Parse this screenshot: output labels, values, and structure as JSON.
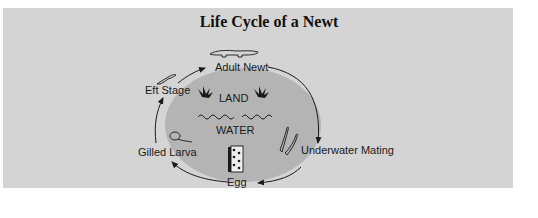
{
  "title": "Life Cycle of a Newt",
  "zones": {
    "land": "LAND",
    "water": "WATER"
  },
  "stages": [
    {
      "id": "adult",
      "label": "Adult Newt",
      "icon": "adult-newt-icon"
    },
    {
      "id": "mating",
      "label": "Underwater Mating",
      "icon": "mating-newts-icon"
    },
    {
      "id": "egg",
      "label": "Egg",
      "icon": "egg-mass-icon"
    },
    {
      "id": "larva",
      "label": "Gilled Larva",
      "icon": "larva-icon"
    },
    {
      "id": "eft",
      "label": "Eft Stage",
      "icon": "eft-icon"
    }
  ],
  "colors": {
    "panel": "#d4d4d4",
    "ellipse": "#b4b4b4",
    "ink": "#1a1a1a"
  }
}
